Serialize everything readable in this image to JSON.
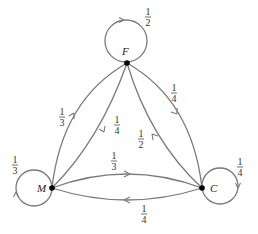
{
  "diagram": {
    "type": "markov-chain",
    "colors": {
      "edge": "#7a7a7a",
      "node": "#000000",
      "text": "#222222"
    },
    "nodes": [
      {
        "id": "F",
        "label": "F"
      },
      {
        "id": "M",
        "label": "M"
      },
      {
        "id": "C",
        "label": "C"
      }
    ],
    "edges": [
      {
        "from": "F",
        "to": "F",
        "num": "1",
        "den": "2"
      },
      {
        "from": "M",
        "to": "M",
        "num": "1",
        "den": "3"
      },
      {
        "from": "C",
        "to": "C",
        "num": "1",
        "den": "4"
      },
      {
        "from": "M",
        "to": "F",
        "num": "1",
        "den": "3"
      },
      {
        "from": "F",
        "to": "M",
        "num": "1",
        "den": "4"
      },
      {
        "from": "F",
        "to": "C",
        "num": "1",
        "den": "4"
      },
      {
        "from": "C",
        "to": "F",
        "num": "1",
        "den": "2"
      },
      {
        "from": "M",
        "to": "C",
        "num": "1",
        "den": "3"
      },
      {
        "from": "C",
        "to": "M",
        "num": "1",
        "den": "4"
      }
    ]
  }
}
